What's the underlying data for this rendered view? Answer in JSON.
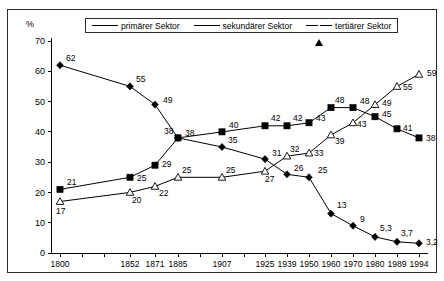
{
  "frame": {
    "unit_label": "%"
  },
  "legend": {
    "position": "top-center",
    "items": [
      {
        "label": "primärer Sektor",
        "marker": "diamond-marker-icon"
      },
      {
        "label": "sekundärer Sektor",
        "marker": "square-marker-icon"
      },
      {
        "label": "tertiärer Sektor",
        "marker": "triangle-marker-icon"
      }
    ]
  },
  "chart_data": {
    "type": "line",
    "title": "",
    "xlabel": "",
    "ylabel": "%",
    "ylim": [
      0,
      70
    ],
    "yticks": [
      0,
      10,
      20,
      30,
      40,
      50,
      60,
      70
    ],
    "ytick_labels": [
      "0",
      "10",
      "20",
      "30",
      "40",
      "50",
      "60",
      "70"
    ],
    "grid": false,
    "legend_position": "top-center",
    "categories": [
      "1800",
      "1852",
      "1871",
      "1885",
      "1907",
      "1925",
      "1939",
      "1950",
      "1960",
      "1970",
      "1980",
      "1989",
      "1994"
    ],
    "series": [
      {
        "name": "primärer Sektor",
        "marker": "diamond",
        "values": [
          62,
          55,
          49,
          38,
          35,
          31,
          26,
          25,
          13,
          9,
          5.3,
          3.7,
          3.2
        ],
        "point_labels": [
          "62",
          "55",
          "49",
          "38",
          "35",
          "31",
          "26",
          "25",
          "13",
          "9",
          "5,3",
          "3,7",
          "3,2"
        ]
      },
      {
        "name": "sekundärer Sektor",
        "marker": "square",
        "values": [
          21,
          25,
          29,
          38,
          40,
          42,
          42,
          43,
          48,
          48,
          45,
          41,
          38
        ],
        "point_labels": [
          "21",
          "25",
          "29",
          "38",
          "40",
          "42",
          "42",
          "43",
          "48",
          "48",
          "45",
          "41",
          "38"
        ]
      },
      {
        "name": "tertiärer Sektor",
        "marker": "triangle",
        "values": [
          17,
          20,
          22,
          25,
          25,
          27,
          32,
          33,
          39,
          43,
          49,
          55,
          59
        ],
        "point_labels": [
          "17",
          "20",
          "22",
          "25",
          "25",
          "27",
          "32",
          "33",
          "39",
          "43",
          "49",
          "55",
          "59"
        ]
      }
    ]
  },
  "colors": {
    "line": "#000000",
    "frame": "#2b2b2b",
    "background": "#ffffff"
  }
}
